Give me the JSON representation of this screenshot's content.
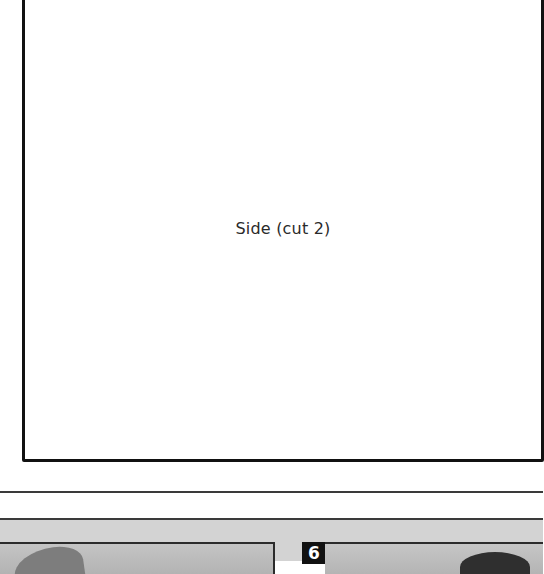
{
  "pattern_piece": {
    "label": "Side (cut 2)"
  },
  "photo_strip": {
    "photos": [
      {
        "step": "",
        "description": "step photo (partial)"
      },
      {
        "step": "6",
        "description": "step photo (partial)"
      }
    ]
  },
  "colors": {
    "border": "#111111",
    "rule": "#3a3a3a",
    "strip_background": "#d3d3d3",
    "badge_background": "#111111",
    "badge_text": "#ffffff"
  }
}
